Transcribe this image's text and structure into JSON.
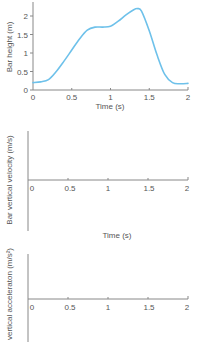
{
  "chart_data": [
    {
      "type": "line",
      "title": "",
      "xlabel": "Time (s)",
      "ylabel": "Bar height (m)",
      "xlim": [
        0,
        2
      ],
      "ylim": [
        0,
        2.2
      ],
      "xticks": [
        "0",
        "0.5",
        "1",
        "1.5",
        "2"
      ],
      "yticks": [
        "0",
        "0.5",
        "1",
        "1.5",
        "2"
      ],
      "grid": false,
      "series": [
        {
          "name": "Bar height",
          "color": "#6ec1ea",
          "x": [
            0,
            0.1,
            0.2,
            0.3,
            0.4,
            0.5,
            0.6,
            0.7,
            0.8,
            0.9,
            1.0,
            1.1,
            1.2,
            1.3,
            1.35,
            1.4,
            1.5,
            1.6,
            1.7,
            1.8,
            1.9,
            2.0
          ],
          "values": [
            0.2,
            0.22,
            0.28,
            0.5,
            0.78,
            1.08,
            1.38,
            1.62,
            1.7,
            1.7,
            1.72,
            1.86,
            2.03,
            2.17,
            2.2,
            2.13,
            1.6,
            0.95,
            0.42,
            0.2,
            0.17,
            0.18
          ]
        }
      ]
    },
    {
      "type": "line",
      "title": "",
      "xlabel": "Time (s)",
      "ylabel": "Bar vertical velocity (m/s)",
      "xlim": [
        0,
        2
      ],
      "xticks": [
        "0",
        "0.5",
        "1",
        "1.5",
        "2"
      ],
      "grid": false,
      "series": []
    },
    {
      "type": "line",
      "title": "",
      "xlabel": "",
      "ylabel": "vertical acceleraton (m/s²)",
      "xlim": [
        0,
        2
      ],
      "xticks": [
        "0",
        "0.5",
        "1",
        "1.5",
        "2"
      ],
      "grid": false,
      "series": []
    }
  ],
  "charts": {
    "height": {
      "ylabel": "Bar height (m)",
      "xlabel": "Time (s)",
      "xticks": [
        "0",
        "0.5",
        "1",
        "1.5",
        "2"
      ],
      "yticks": [
        "0",
        "0.5",
        "1",
        "1.5",
        "2"
      ]
    },
    "velocity": {
      "ylabel": "Bar vertical velocity (m/s)",
      "xlabel": "Time (s)",
      "xticks": [
        "0",
        "0.5",
        "1",
        "1.5",
        "2"
      ]
    },
    "acceleration": {
      "ylabel": "vertical acceleraton (m/s²)",
      "xticks": [
        "0",
        "0.5",
        "1",
        "1.5",
        "2"
      ]
    }
  },
  "colors": {
    "curve": "#6ec1ea",
    "axis": "#888888"
  }
}
